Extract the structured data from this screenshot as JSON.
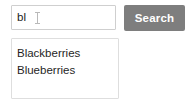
{
  "search": {
    "input_value": "bl",
    "placeholder": "",
    "cursor_icon": "ibeam-text-cursor",
    "button_label": "Search",
    "button_color": "#7e7e7e",
    "button_text_color": "#ffffff",
    "input_border_color": "#cfcfcf",
    "input_text_color": "#1a1a1a"
  },
  "suggestions": {
    "border_color": "#dedede",
    "background_color": "#ffffff",
    "text_color": "#1f1f1f",
    "items": [
      {
        "label": "Blackberries"
      },
      {
        "label": "Blueberries"
      }
    ]
  },
  "page": {
    "background_color": "#ffffff"
  }
}
